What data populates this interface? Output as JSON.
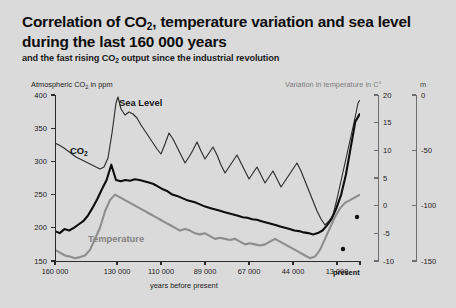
{
  "header": {
    "title_line1": "Correlation of CO",
    "title_line1_sub": "2",
    "title_line1_rest": ", temperature variation and sea level",
    "title_line2": "during the last 160 000 years",
    "subtitle_pre": "and the fast rising CO",
    "subtitle_sub": "2",
    "subtitle_post": " output since the industrial revolution"
  },
  "captions": {
    "left_axis_pre": "Atmospheric CO",
    "left_axis_sub": "2",
    "left_axis_post": " in ppm",
    "temp_axis": "Variation in temperature in C°",
    "sea_axis": "m",
    "xaxis_title": "years before present",
    "present": "present"
  },
  "series_labels": {
    "sea_level": "Sea Level",
    "co2_pre": "CO",
    "co2_sub": "2",
    "temperature": "Temperature"
  },
  "colors": {
    "background": "#dadada",
    "co2": "#0d0d0d",
    "sea_level": "#2e2e2e",
    "temperature": "#8d8d8d",
    "axis": "#2b2b2b",
    "right_axis": "#6e6e6e"
  },
  "chart_data": {
    "type": "line",
    "title": "Correlation of CO2, temperature variation and sea level during the last 160 000 years",
    "subtitle": "and the fast rising CO2 output since the industrial revolution",
    "xlabel": "years before present",
    "grid": false,
    "legend": "inline-labels",
    "x_axis": {
      "tick_labels": [
        "160 000",
        "130 000",
        "110 000",
        "89 000",
        "67 000",
        "44 000",
        "13 000",
        "present"
      ],
      "tick_values": [
        160000,
        130000,
        110000,
        89000,
        67000,
        44000,
        13000,
        0
      ],
      "tick_positions_px": [
        0,
        62,
        106,
        150,
        194,
        238,
        282,
        305
      ],
      "direction": "oldest-left-to-present-right"
    },
    "y_axes": [
      {
        "name": "Atmospheric CO2 in ppm",
        "side": "left",
        "ticks": [
          150,
          200,
          250,
          300,
          350,
          400
        ],
        "range": [
          150,
          400
        ],
        "unit": "ppm",
        "series": "co2"
      },
      {
        "name": "Variation in temperature in C°",
        "side": "right-inner",
        "ticks": [
          -10,
          -5,
          0,
          5,
          10,
          15,
          20
        ],
        "range": [
          -10,
          20
        ],
        "unit": "C°",
        "series": "temperature"
      },
      {
        "name": "m",
        "side": "right-outer",
        "ticks": [
          0,
          -50,
          -100,
          -150
        ],
        "range": [
          -150,
          0
        ],
        "unit": "m",
        "series": "sea_level"
      }
    ],
    "series": [
      {
        "name": "Sea Level",
        "axis": "m",
        "color": "#2e2e2e",
        "style": "thin",
        "note": "plotted on right-outer axis, 0 m at top to -150 m at bottom; high early, steep rise at far right",
        "points_px": [
          [
            0,
            48
          ],
          [
            4,
            50
          ],
          [
            9,
            53
          ],
          [
            13,
            56
          ],
          [
            17,
            59
          ],
          [
            21,
            62
          ],
          [
            25,
            64
          ],
          [
            29,
            66
          ],
          [
            33,
            68
          ],
          [
            37,
            70
          ],
          [
            41,
            72
          ],
          [
            45,
            74
          ],
          [
            49,
            72
          ],
          [
            53,
            63
          ],
          [
            57,
            38
          ],
          [
            61,
            8
          ],
          [
            63,
            2
          ],
          [
            66,
            14
          ],
          [
            70,
            20
          ],
          [
            74,
            17
          ],
          [
            78,
            19
          ],
          [
            82,
            23
          ],
          [
            86,
            30
          ],
          [
            90,
            36
          ],
          [
            94,
            42
          ],
          [
            98,
            48
          ],
          [
            102,
            54
          ],
          [
            106,
            59
          ],
          [
            110,
            49
          ],
          [
            114,
            38
          ],
          [
            118,
            44
          ],
          [
            122,
            52
          ],
          [
            126,
            60
          ],
          [
            130,
            68
          ],
          [
            134,
            62
          ],
          [
            138,
            55
          ],
          [
            142,
            47
          ],
          [
            146,
            56
          ],
          [
            150,
            64
          ],
          [
            154,
            58
          ],
          [
            158,
            52
          ],
          [
            162,
            60
          ],
          [
            166,
            70
          ],
          [
            170,
            78
          ],
          [
            174,
            72
          ],
          [
            178,
            66
          ],
          [
            182,
            60
          ],
          [
            186,
            68
          ],
          [
            190,
            76
          ],
          [
            194,
            84
          ],
          [
            198,
            78
          ],
          [
            202,
            72
          ],
          [
            206,
            80
          ],
          [
            210,
            88
          ],
          [
            214,
            82
          ],
          [
            218,
            76
          ],
          [
            222,
            84
          ],
          [
            226,
            92
          ],
          [
            230,
            86
          ],
          [
            234,
            80
          ],
          [
            238,
            74
          ],
          [
            242,
            68
          ],
          [
            246,
            76
          ],
          [
            250,
            86
          ],
          [
            254,
            96
          ],
          [
            258,
            106
          ],
          [
            262,
            116
          ],
          [
            266,
            124
          ],
          [
            270,
            130
          ],
          [
            274,
            126
          ],
          [
            278,
            120
          ],
          [
            282,
            104
          ],
          [
            286,
            86
          ],
          [
            290,
            68
          ],
          [
            294,
            50
          ],
          [
            298,
            32
          ],
          [
            301,
            18
          ],
          [
            303,
            8
          ],
          [
            305,
            5
          ],
          [
            305,
            5
          ]
        ]
      },
      {
        "name": "CO2",
        "axis": "ppm",
        "color": "#0d0d0d",
        "style": "thick",
        "note": "150-400 ppm left axis; ~195 ppm at 160 ka, ~295 ppm peak at 130 ka, ~190-200 ppm glacial, rises sharply to ~370 ppm present",
        "values_ppm_approx": [
          195,
          192,
          198,
          196,
          200,
          205,
          210,
          218,
          230,
          243,
          258,
          272,
          295,
          272,
          270,
          272,
          271,
          273,
          272,
          270,
          268,
          266,
          262,
          258,
          255,
          250,
          248,
          245,
          242,
          240,
          238,
          235,
          232,
          230,
          228,
          226,
          224,
          222,
          220,
          218,
          216,
          215,
          213,
          212,
          210,
          208,
          206,
          204,
          202,
          200,
          198,
          196,
          195,
          193,
          192,
          190,
          192,
          196,
          204,
          214,
          230,
          250,
          280,
          320,
          360,
          372
        ],
        "markers_px": [
          [
            288,
            154
          ],
          [
            302,
            122
          ]
        ]
      },
      {
        "name": "Temperature",
        "axis": "C°",
        "color": "#8d8d8d",
        "style": "thick",
        "note": "variation in C degrees, roughly -9 at glacial maxima to ~+2 at interglacials and present",
        "values_c_approx": [
          -8,
          -8.5,
          -9,
          -9.2,
          -9.5,
          -9.3,
          -9,
          -8,
          -6,
          -4,
          -1,
          1,
          2,
          1.5,
          1,
          0.5,
          0,
          -0.5,
          -1,
          -1.5,
          -2,
          -2.5,
          -3,
          -3.5,
          -4,
          -4.5,
          -4.2,
          -4.5,
          -5,
          -5.2,
          -5,
          -5.5,
          -6,
          -5.8,
          -6,
          -6.2,
          -6,
          -6.5,
          -7,
          -6.8,
          -7,
          -7.2,
          -7,
          -6.5,
          -6,
          -6.5,
          -7,
          -7.5,
          -8,
          -8.5,
          -9,
          -9.5,
          -9.2,
          -8,
          -6,
          -4,
          -2,
          -0.5,
          0.5,
          1,
          1.5,
          2
        ]
      }
    ]
  }
}
